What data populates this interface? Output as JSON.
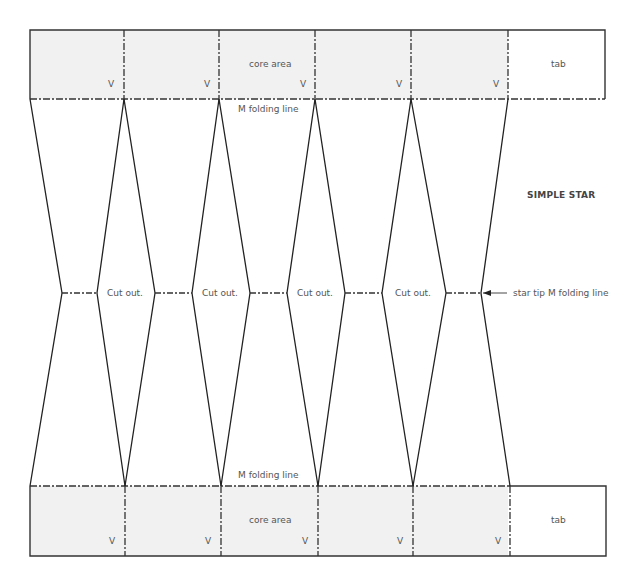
{
  "title": "SIMPLE STAR",
  "colors": {
    "core_fill": "#f1f1f1",
    "line": "#222222",
    "text": "#555555"
  },
  "top_strip": {
    "core_label": "core area",
    "tab_label": "tab",
    "v_labels": [
      "V",
      "V",
      "V",
      "V",
      "V"
    ],
    "fold_label": "M folding line"
  },
  "bottom_strip": {
    "core_label": "core area",
    "tab_label": "tab",
    "v_labels": [
      "V",
      "V",
      "V",
      "V",
      "V"
    ],
    "fold_label": "M folding line"
  },
  "middle": {
    "cut_labels": [
      "Cut out.",
      "Cut out.",
      "Cut out.",
      "Cut out."
    ],
    "star_tip_label": "star tip M folding line"
  }
}
